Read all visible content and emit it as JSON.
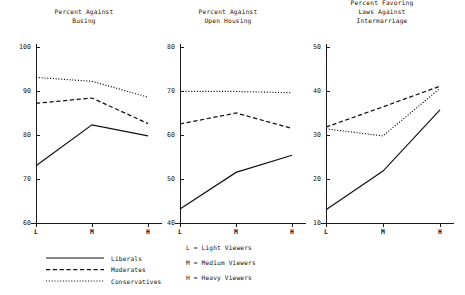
{
  "figure": {
    "background": "#ffffff",
    "ink_color": "#141414"
  },
  "legend": {
    "name": "series-legend",
    "entries": [
      {
        "label": "Liberals",
        "style": "solid"
      },
      {
        "label": "Moderates",
        "style": "dashed"
      },
      {
        "label": "Conservatives",
        "style": "dotted"
      }
    ]
  },
  "key": {
    "name": "viewer-key",
    "lines": [
      "L = Light Viewers",
      "M = Medium Viewers",
      "H = Heavy Viewers"
    ]
  },
  "chart_data": [
    {
      "type": "line",
      "name": "busing-chart",
      "title": "Percent Against\nBusing",
      "title_lines": [
        "Percent Against",
        "Busing"
      ],
      "xlabel": "",
      "ylabel": "",
      "categories": [
        "L",
        "M",
        "H"
      ],
      "tick_labels": [
        "100",
        "90",
        "80",
        "70",
        "60"
      ],
      "ticks": [
        100,
        90,
        80,
        70,
        60
      ],
      "ylim": [
        60,
        100
      ],
      "grid": false,
      "legend_position": "below-figure",
      "series": [
        {
          "name": "Liberals",
          "style": "solid",
          "values": [
            73,
            82.3,
            79.8
          ]
        },
        {
          "name": "Moderates",
          "style": "dashed",
          "values": [
            87.2,
            88.4,
            82.6
          ]
        },
        {
          "name": "Conservatives",
          "style": "dotted",
          "values": [
            93.1,
            92.2,
            88.6
          ]
        }
      ]
    },
    {
      "type": "line",
      "name": "open-housing-chart",
      "title": "Percent Against\nOpen Housing",
      "title_lines": [
        "Percent Against",
        "Open Housing"
      ],
      "xlabel": "",
      "ylabel": "",
      "categories": [
        "L",
        "M",
        "H"
      ],
      "tick_labels": [
        "80",
        "70",
        "60",
        "50",
        "40"
      ],
      "ticks": [
        80,
        70,
        60,
        50,
        40
      ],
      "ylim": [
        40,
        80
      ],
      "grid": false,
      "legend_position": "below-figure",
      "series": [
        {
          "name": "Liberals",
          "style": "solid",
          "values": [
            43.2,
            51.5,
            55.4
          ]
        },
        {
          "name": "Moderates",
          "style": "dashed",
          "values": [
            62.5,
            65.0,
            61.5
          ]
        },
        {
          "name": "Conservatives",
          "style": "dotted",
          "values": [
            69.9,
            69.9,
            69.6
          ]
        }
      ]
    },
    {
      "type": "line",
      "name": "intermarriage-chart",
      "title": "Percent Favoring\nLaws Against\nIntermarriage",
      "title_lines": [
        "Percent Favoring",
        "Laws Against",
        "Intermarriage"
      ],
      "xlabel": "",
      "ylabel": "",
      "categories": [
        "L",
        "M",
        "H"
      ],
      "tick_labels": [
        "50",
        "40",
        "30",
        "20",
        "10"
      ],
      "ticks": [
        50,
        40,
        30,
        20,
        10
      ],
      "ylim": [
        10,
        50
      ],
      "grid": false,
      "legend_position": "below-figure",
      "series": [
        {
          "name": "Liberals",
          "style": "solid",
          "values": [
            13.0,
            21.8,
            35.7
          ]
        },
        {
          "name": "Moderates",
          "style": "dashed",
          "values": [
            31.8,
            36.4,
            41.1
          ]
        },
        {
          "name": "Conservatives",
          "style": "dotted",
          "values": [
            31.4,
            29.8,
            40.6
          ]
        }
      ]
    }
  ]
}
